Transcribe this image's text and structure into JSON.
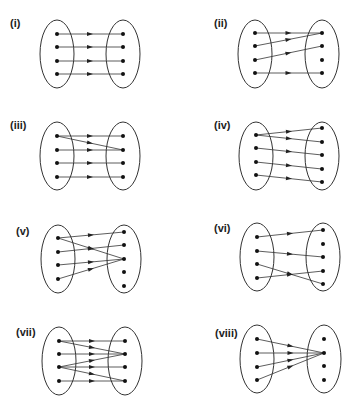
{
  "diagrams": [
    {
      "id": "i",
      "label": "(i)",
      "label_pos": [
        10,
        27
      ],
      "left": {
        "cx": 57,
        "cy": 54,
        "rx": 17,
        "ry": 34,
        "dots": [
          34,
          47,
          61,
          74
        ]
      },
      "right": {
        "cx": 123,
        "cy": 54,
        "rx": 17,
        "ry": 34,
        "dots": [
          34,
          47,
          61,
          74
        ]
      },
      "mapping": [
        [
          0,
          0
        ],
        [
          1,
          1
        ],
        [
          2,
          2
        ],
        [
          3,
          3
        ]
      ]
    },
    {
      "id": "ii",
      "label": "(ii)",
      "label_pos": [
        214,
        27
      ],
      "left": {
        "cx": 255,
        "cy": 54,
        "rx": 17,
        "ry": 34,
        "dots": [
          33,
          46,
          60,
          73
        ]
      },
      "right": {
        "cx": 322,
        "cy": 54,
        "rx": 17,
        "ry": 34,
        "dots": [
          33,
          46,
          60,
          73
        ]
      },
      "mapping": [
        [
          0,
          0
        ],
        [
          1,
          0
        ],
        [
          2,
          1
        ],
        [
          3,
          3
        ]
      ]
    },
    {
      "id": "iii",
      "label": "(iii)",
      "label_pos": [
        10,
        129
      ],
      "left": {
        "cx": 57,
        "cy": 156,
        "rx": 17,
        "ry": 34,
        "dots": [
          136,
          150,
          163,
          177
        ]
      },
      "right": {
        "cx": 123,
        "cy": 156,
        "rx": 17,
        "ry": 34,
        "dots": [
          136,
          150,
          163,
          177
        ]
      },
      "mapping": [
        [
          0,
          0
        ],
        [
          0,
          1
        ],
        [
          1,
          1
        ],
        [
          2,
          2
        ],
        [
          3,
          3
        ]
      ]
    },
    {
      "id": "iv",
      "label": "(iv)",
      "label_pos": [
        214,
        129
      ],
      "left": {
        "cx": 256,
        "cy": 156,
        "rx": 17,
        "ry": 34,
        "dots": [
          135,
          148,
          162,
          175
        ]
      },
      "right": {
        "cx": 322,
        "cy": 156,
        "rx": 17,
        "ry": 34,
        "dots": [
          128,
          142,
          155,
          169,
          182
        ]
      },
      "mapping": [
        [
          0,
          0
        ],
        [
          0,
          1
        ],
        [
          1,
          2
        ],
        [
          2,
          3
        ],
        [
          3,
          4
        ]
      ]
    },
    {
      "id": "v",
      "label": "(v)",
      "label_pos": [
        16,
        235
      ],
      "left": {
        "cx": 58,
        "cy": 259,
        "rx": 17,
        "ry": 34,
        "dots": [
          238,
          252,
          265,
          279
        ]
      },
      "right": {
        "cx": 124,
        "cy": 259,
        "rx": 17,
        "ry": 34,
        "dots": [
          232,
          245,
          259,
          272,
          286
        ]
      },
      "mapping": [
        [
          0,
          0
        ],
        [
          0,
          2
        ],
        [
          1,
          1
        ],
        [
          2,
          2
        ],
        [
          3,
          2
        ]
      ]
    },
    {
      "id": "vi",
      "label": "(vi)",
      "label_pos": [
        214,
        232
      ],
      "left": {
        "cx": 257,
        "cy": 257,
        "rx": 17,
        "ry": 34,
        "dots": [
          237,
          251,
          264,
          278
        ]
      },
      "right": {
        "cx": 323,
        "cy": 257,
        "rx": 17,
        "ry": 34,
        "dots": [
          230,
          244,
          257,
          271,
          284
        ]
      },
      "mapping": [
        [
          0,
          0
        ],
        [
          1,
          2
        ],
        [
          2,
          4
        ],
        [
          3,
          3
        ]
      ]
    },
    {
      "id": "vii",
      "label": "(vii)",
      "label_pos": [
        16,
        336
      ],
      "left": {
        "cx": 59,
        "cy": 361,
        "rx": 17,
        "ry": 34,
        "dots": [
          341,
          354,
          367,
          381
        ]
      },
      "right": {
        "cx": 125,
        "cy": 361,
        "rx": 17,
        "ry": 34,
        "dots": [
          341,
          354,
          367,
          381
        ]
      },
      "mapping": [
        [
          0,
          0
        ],
        [
          0,
          1
        ],
        [
          1,
          1
        ],
        [
          2,
          1
        ],
        [
          2,
          2
        ],
        [
          2,
          3
        ],
        [
          3,
          3
        ]
      ]
    },
    {
      "id": "viii",
      "label": "(viii)",
      "label_pos": [
        215,
        337
      ],
      "left": {
        "cx": 257,
        "cy": 359,
        "rx": 17,
        "ry": 34,
        "dots": [
          339,
          353,
          367,
          380
        ]
      },
      "right": {
        "cx": 324,
        "cy": 359,
        "rx": 17,
        "ry": 34,
        "dots": [
          339,
          353,
          366,
          380
        ]
      },
      "mapping": [
        [
          0,
          1
        ],
        [
          1,
          1
        ],
        [
          2,
          1
        ],
        [
          3,
          1
        ]
      ]
    }
  ]
}
